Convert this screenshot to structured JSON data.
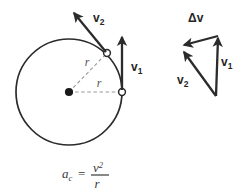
{
  "figure": {
    "background_color": "#ffffff",
    "stroke_color": "#2b2b2b",
    "dashed_color": "#8c8c8c",
    "text_color": "#262626"
  },
  "circle_diagram": {
    "center_marker": "center-dot",
    "circle": {
      "cx": 69,
      "cy": 92,
      "r": 53,
      "stroke": "#2b2b2b",
      "stroke_width": 1.7
    },
    "radius_labels": [
      {
        "text": "r",
        "x": 87,
        "y": 66
      },
      {
        "text": "r",
        "x": 99,
        "y": 87
      }
    ],
    "points": [
      {
        "name": "point-p1",
        "x": 122,
        "y": 92,
        "marker": "open-circle"
      },
      {
        "name": "point-p2",
        "x": 107,
        "y": 53,
        "marker": "open-circle"
      }
    ],
    "vectors": [
      {
        "name": "v1",
        "label": "v",
        "subscript": "1",
        "label_x": 131,
        "label_y": 71,
        "from": {
          "x": 122,
          "y": 90
        },
        "to": {
          "x": 122,
          "y": 35
        }
      },
      {
        "name": "v2",
        "label": "v",
        "subscript": "2",
        "label_x": 93,
        "label_y": 22,
        "from": {
          "x": 106,
          "y": 52
        },
        "to": {
          "x": 72,
          "y": 11
        }
      }
    ]
  },
  "formula": {
    "acceleration_symbol": "a",
    "acceleration_subscript": "c",
    "equals": "=",
    "numerator": "v",
    "numerator_exponent": "2",
    "denominator": "r",
    "full_text": "a_c = v^2 / r"
  },
  "vector_triangle": {
    "caption": "velocity change triangle",
    "vertices": {
      "top_right": {
        "x": 218,
        "y": 36
      },
      "left": {
        "x": 181,
        "y": 46
      },
      "bottom": {
        "x": 216,
        "y": 96
      }
    },
    "vectors": [
      {
        "name": "delta-v",
        "label": "Δv",
        "label_x": 188,
        "label_y": 21,
        "from": {
          "x": 218,
          "y": 36
        },
        "to": {
          "x": 181,
          "y": 46
        }
      },
      {
        "name": "v1",
        "label": "v",
        "subscript": "1",
        "label_x": 221,
        "label_y": 66,
        "from": {
          "x": 216,
          "y": 96
        },
        "to": {
          "x": 218,
          "y": 36
        }
      },
      {
        "name": "v2",
        "label": "v",
        "subscript": "2",
        "label_x": 180,
        "label_y": 84,
        "from": {
          "x": 216,
          "y": 96
        },
        "to": {
          "x": 182,
          "y": 50
        }
      }
    ]
  }
}
